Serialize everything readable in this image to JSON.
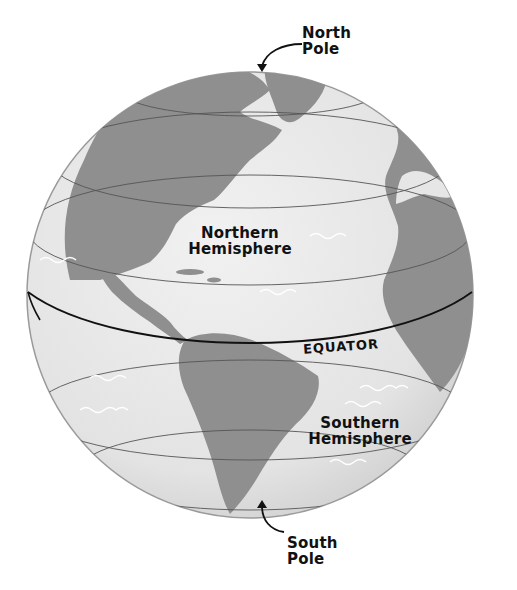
{
  "diagram": {
    "labels": {
      "north_pole": [
        "North",
        "Pole"
      ],
      "south_pole": [
        "South",
        "Pole"
      ],
      "northern_hemisphere": [
        "Northern",
        "Hemisphere"
      ],
      "southern_hemisphere": [
        "Southern",
        "Hemisphere"
      ],
      "equator": "EQUATOR"
    },
    "colors": {
      "ocean": "#e8e8e8",
      "land": "#8f8f8f",
      "latitude_lines": "#555555",
      "equator_line": "#111111",
      "waves": "#ffffff",
      "text": "#111111"
    }
  }
}
